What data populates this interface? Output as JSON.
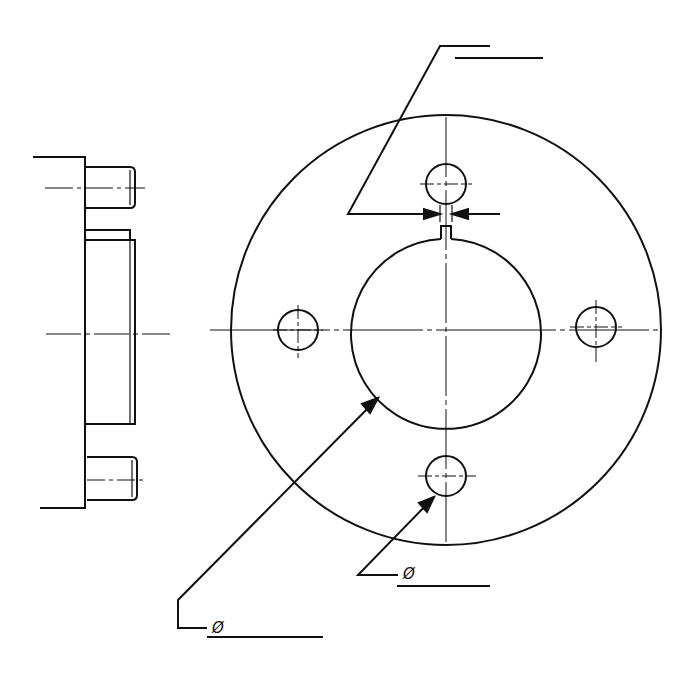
{
  "drawing": {
    "type": "flange technical drawing",
    "views": [
      "side-section-view",
      "front-view"
    ],
    "stroke_color": "#111111",
    "background": "#ffffff"
  },
  "annotations": {
    "inner_bore_diameter": {
      "symbol": "Ø",
      "value": ""
    },
    "bolt_hole_diameter": {
      "symbol": "Ø",
      "value": ""
    },
    "keyway_width": {
      "value": ""
    }
  }
}
